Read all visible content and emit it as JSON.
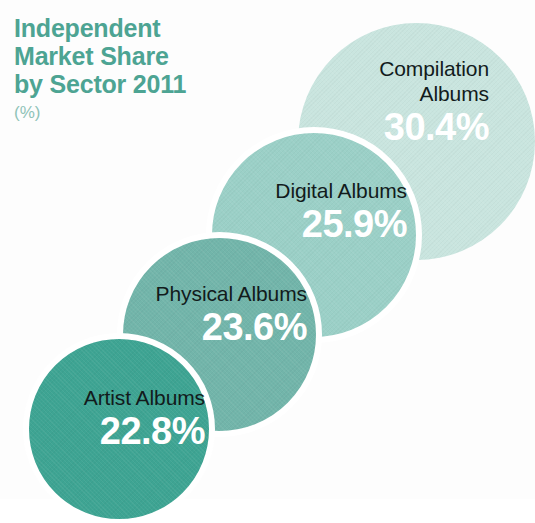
{
  "chart_data": {
    "type": "bar",
    "title": "Independent Market Share by Sector 2011",
    "subtitle": "(%)",
    "xlabel": "",
    "ylabel": "Market Share",
    "unit": "%",
    "categories": [
      "Artist Albums",
      "Physical Albums",
      "Digital Albums",
      "Compilation Albums"
    ],
    "values": [
      22.8,
      23.6,
      25.9,
      30.4
    ],
    "value_labels": [
      "22.8%",
      "23.6%",
      "25.9%",
      "30.4%"
    ],
    "legend": [],
    "grid": false,
    "note": "Proportional overlapping-circle (bubble) chart; circle size scales with percentage, arranged diagonally from bottom-left (smallest) to top-right (largest)."
  },
  "title": {
    "line1": "Independent",
    "line2": "Market Share",
    "line3": "by Sector 2011",
    "unit": "(%)"
  },
  "bubbles": [
    {
      "key": "compilation",
      "name": "Compilation",
      "name_line1": "Compilation",
      "name_line2": "Albums",
      "value": "30.4%",
      "color": "#c9e5df"
    },
    {
      "key": "digital",
      "name": "Digital Albums",
      "value": "25.9%",
      "color": "#9bd0c7"
    },
    {
      "key": "physical",
      "name": "Physical Albums",
      "value": "23.6%",
      "color": "#72b5aa"
    },
    {
      "key": "artist",
      "name": "Artist Albums",
      "value": "22.8%",
      "color": "#3ea493"
    }
  ],
  "colors": {
    "title": "#4da493",
    "subtitle": "#8fc3b8",
    "label_text": "#121b1c",
    "value_text": "#ffffff",
    "background": "#fdfdfd",
    "ring": "#ffffff"
  }
}
